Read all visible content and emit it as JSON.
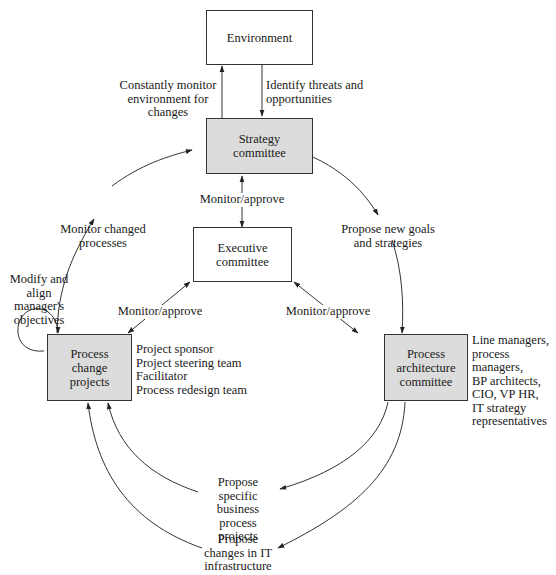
{
  "diagram": {
    "type": "governance-flow",
    "colors": {
      "shaded_box_fill": "#dcdcdc",
      "plain_box_fill": "#ffffff",
      "stroke": "#333333"
    },
    "boxes": {
      "environment": {
        "label": "Environment",
        "style": "plain"
      },
      "strategy": {
        "label": "Strategy\ncommittee",
        "style": "shaded"
      },
      "executive": {
        "label": "Executive\ncommittee",
        "style": "plain"
      },
      "process_change": {
        "label": "Process\nchange\nprojects",
        "style": "shaded"
      },
      "process_architecture": {
        "label": "Process\narchitecture\ncommittee",
        "style": "shaded"
      }
    },
    "edge_labels": {
      "monitor_environment": "Constantly monitor\nenvironment for\nchanges",
      "identify_threats": "Identify threats and\nopportunities",
      "strategy_executive": "Monitor/approve",
      "monitor_changed": "Monitor changed\nprocesses",
      "propose_goals": "Propose new goals\nand strategies",
      "self_loop": "Modify and\nalign manager's\nobjectives",
      "exec_left": "Monitor/approve",
      "exec_right": "Monitor/approve",
      "propose_bp_projects": "Propose specific\nbusiness process\nprojects",
      "propose_it_changes": "Propose\nchanges in IT\ninfrastructure"
    },
    "member_lists": {
      "process_change": "Project sponsor\nProject steering team\nFacilitator\nProcess redesign team",
      "process_architecture": "Line managers,\nprocess managers,\nBP architects,\nCIO, VP HR,\nIT strategy\nrepresentatives"
    }
  }
}
